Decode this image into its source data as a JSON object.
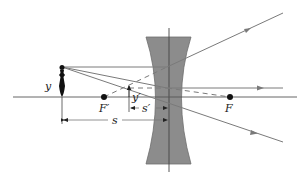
{
  "diagram": {
    "labels": {
      "object_height": "y",
      "image_height": "y′",
      "object_distance": "s",
      "image_distance": "s′",
      "front_focal_point": "F′",
      "back_focal_point": "F"
    },
    "colors": {
      "lens_fill": "#8c8c8c",
      "ray": "#7a7a7a",
      "axis": "#555555",
      "object": "#111111",
      "focal_point": "#111111"
    },
    "geometry": {
      "optical_axis_y": 97,
      "lens_center_x": 169,
      "object_x": 62,
      "object_top_y": 67,
      "image_x": 129,
      "image_top_y": 85,
      "focal_point_front_x": 104,
      "focal_point_back_x": 230
    }
  }
}
